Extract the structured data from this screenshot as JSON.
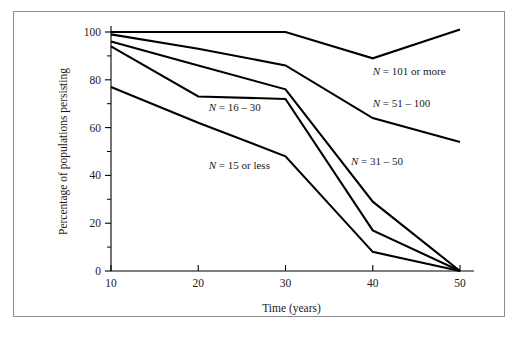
{
  "figure": {
    "frame_color": "#8c8c8c",
    "background_color": "#ffffff",
    "line_color": "#000000"
  },
  "chart_data": {
    "type": "line",
    "title": "",
    "xlabel": "Time (years)",
    "ylabel": "Percentage of populations persisting",
    "x": [
      10,
      20,
      30,
      40,
      50
    ],
    "xlim": [
      10,
      50
    ],
    "ylim": [
      0,
      100
    ],
    "xticks": [
      10,
      20,
      30,
      40,
      50
    ],
    "xtick_labels": [
      "10",
      "20",
      "30",
      "40",
      "50"
    ],
    "yticks": [
      0,
      20,
      40,
      60,
      80,
      100
    ],
    "ytick_labels": [
      "0",
      "20",
      "40",
      "60",
      "80",
      "100"
    ],
    "yticks_minor": [
      10,
      30,
      50,
      70,
      90
    ],
    "grid": false,
    "legend": "inline-labels",
    "series": [
      {
        "name": "N = 101 or more",
        "label": "N = 101 or more",
        "label_n": "N",
        "label_rest": " = 101 or more",
        "values": [
          100,
          100,
          100,
          89,
          101
        ],
        "label_x": 40.0,
        "label_y": 82.0
      },
      {
        "name": "N = 51 – 100",
        "label": "N = 51 – 100",
        "label_n": "N",
        "label_rest": " = 51 – 100",
        "values": [
          99,
          93,
          86,
          64,
          54
        ],
        "label_x": 40.0,
        "label_y": 68.5
      },
      {
        "name": "N = 31 – 50",
        "label": "N = 31 – 50",
        "label_n": "N",
        "label_rest": " = 31 – 50",
        "values": [
          96,
          86,
          76,
          29,
          0
        ],
        "label_x": 37.5,
        "label_y": 44.5
      },
      {
        "name": "N = 16 – 30",
        "label": "N = 16 – 30",
        "label_n": "N",
        "label_rest": " = 16 – 30",
        "values": [
          94,
          73,
          72,
          17,
          0
        ],
        "label_x": 21.2,
        "label_y": 67.0
      },
      {
        "name": "N = 15 or less",
        "label": "N = 15 or less",
        "label_n": "N",
        "label_rest": " = 15 or less",
        "values": [
          77,
          62,
          48,
          8,
          0
        ],
        "label_x": 21.2,
        "label_y": 42.5
      }
    ]
  }
}
